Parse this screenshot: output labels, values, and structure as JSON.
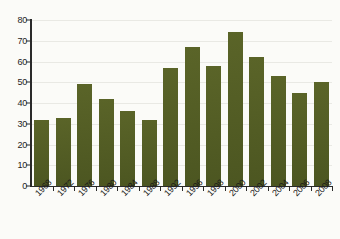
{
  "chart_data": {
    "type": "bar",
    "title": "",
    "xlabel": "",
    "ylabel": "",
    "ylim": [
      0,
      80
    ],
    "yticks": [
      0,
      10,
      20,
      30,
      40,
      50,
      60,
      70,
      80
    ],
    "grid": true,
    "legend": "none",
    "bar_color": "#515c24",
    "categories": [
      "1968",
      "1972",
      "1976",
      "1980",
      "1984",
      "1988",
      "1992",
      "1996",
      "1998",
      "2000",
      "2002",
      "2004",
      "2006",
      "2008"
    ],
    "values": [
      32,
      33,
      49,
      42,
      36,
      32,
      57,
      67,
      58,
      74,
      62,
      53,
      45,
      50
    ]
  }
}
